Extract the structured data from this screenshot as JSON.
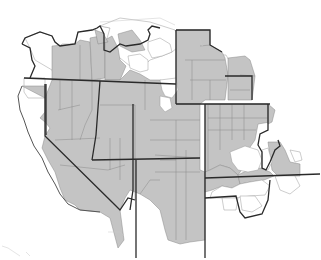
{
  "map": {
    "type": "choropleth",
    "region": "Western United States (county-level)",
    "colors": {
      "shaded": "#c4c4c4",
      "unshaded": "#ffffff",
      "state_border": "#2a2a2a",
      "county_border": "#8a8a8a"
    },
    "legend": null,
    "title": null,
    "labels": []
  }
}
